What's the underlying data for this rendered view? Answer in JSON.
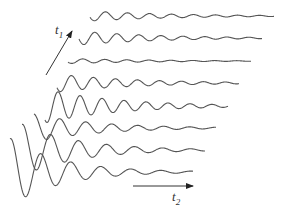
{
  "diagram": {
    "type": "stacked-fid-traces",
    "axis_t1": {
      "label": "t",
      "subscript": "1"
    },
    "axis_t2": {
      "label": "t",
      "subscript": "2"
    },
    "trace_color": "#555555",
    "traces": [
      {
        "index": 1,
        "baseline_y": 16,
        "x_start": 90,
        "x_end": 274,
        "amp": 5,
        "decay": 0.012,
        "period": 22,
        "phase": 3.4
      },
      {
        "index": 2,
        "baseline_y": 38,
        "x_start": 79,
        "x_end": 262,
        "amp": 7,
        "decay": 0.013,
        "period": 22,
        "phase": 3.3
      },
      {
        "index": 3,
        "baseline_y": 61,
        "x_start": 68,
        "x_end": 251,
        "amp": 2.5,
        "decay": 0.012,
        "period": 22,
        "phase": 3.6
      },
      {
        "index": 4,
        "baseline_y": 83,
        "x_start": 57,
        "x_end": 239,
        "amp": 9,
        "decay": 0.013,
        "period": 22,
        "phase": 3.7
      },
      {
        "index": 5,
        "baseline_y": 106,
        "x_start": 45,
        "x_end": 228,
        "amp": 17,
        "decay": 0.014,
        "period": 22,
        "phase": 4.1
      },
      {
        "index": 6,
        "baseline_y": 128,
        "x_start": 34,
        "x_end": 216,
        "amp": 14,
        "decay": 0.016,
        "period": 26,
        "phase": 1.6
      },
      {
        "index": 7,
        "baseline_y": 150,
        "x_start": 22,
        "x_end": 205,
        "amp": 26,
        "decay": 0.018,
        "period": 28,
        "phase": 1.4
      },
      {
        "index": 8,
        "baseline_y": 172,
        "x_start": 10,
        "x_end": 193,
        "amp": 34,
        "decay": 0.02,
        "period": 30,
        "phase": 1.35
      }
    ]
  }
}
